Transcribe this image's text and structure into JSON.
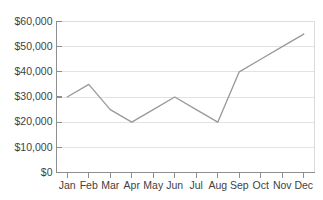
{
  "chart_data": {
    "type": "line",
    "title": "",
    "subtitle": "",
    "xlabel": "",
    "ylabel": "",
    "categories": [
      "Jan",
      "Feb",
      "Mar",
      "Apr",
      "May",
      "Jun",
      "Jul",
      "Aug",
      "Sep",
      "Oct",
      "Nov",
      "Dec"
    ],
    "series": [
      {
        "name": "",
        "values": [
          30000,
          35000,
          25000,
          20000,
          25000,
          30000,
          25000,
          20000,
          40000,
          45000,
          50000,
          55000
        ]
      }
    ],
    "ylim": [
      0,
      60000
    ],
    "ytick_values": [
      0,
      10000,
      20000,
      30000,
      40000,
      50000,
      60000
    ],
    "ytick_labels": [
      "$0",
      "$10,000",
      "$20,000",
      "$30,000",
      "$40,000",
      "$50,000",
      "$60,000"
    ],
    "grid": true,
    "grid_axis": "y",
    "legend": false,
    "legend_position": "none",
    "markers": false,
    "colors": {
      "line": "#9a9a9a",
      "gridline": "#e2e2e2",
      "axis": "#8e8e8e",
      "plot_border": "#dcdcdc",
      "background": "#ffffff",
      "tick_text": "#3f3f3f"
    }
  },
  "axes": {
    "y_axis_name": "y-axis",
    "x_axis_name": "x-axis"
  }
}
